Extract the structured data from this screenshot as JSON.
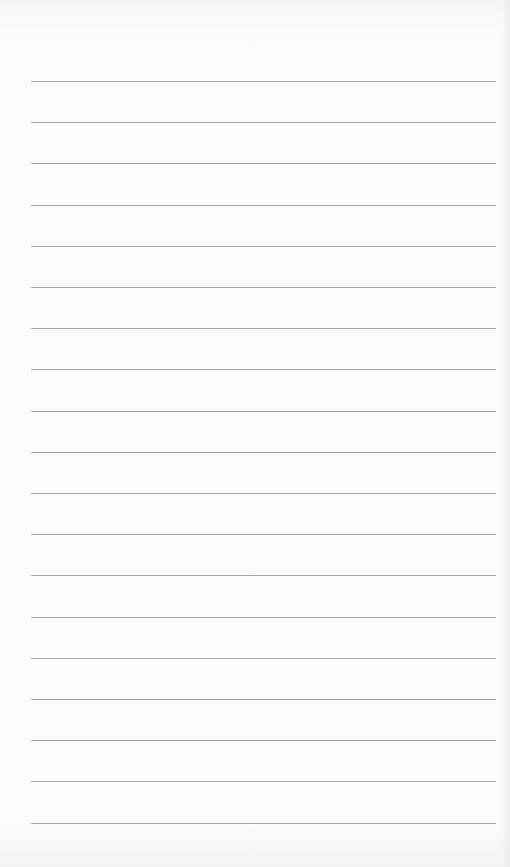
{
  "paper": {
    "type": "lined-paper",
    "line_count": 19,
    "first_line_y": 81,
    "line_spacing": 41.2,
    "line_left": 31,
    "line_width": 465,
    "line_color": "#a6a6a6",
    "background_color": "#fbfbfa"
  }
}
